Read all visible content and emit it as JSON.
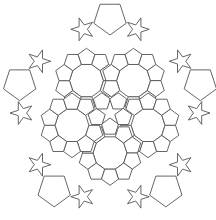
{
  "diagram": {
    "symmetry": "5-fold rotational",
    "colors": {
      "stroke": "#555555",
      "fill": "#ffffff",
      "background": "#ffffff"
    },
    "shape_types": [
      "pentagon",
      "pentagram",
      "decagon",
      "large-pentagon"
    ]
  }
}
